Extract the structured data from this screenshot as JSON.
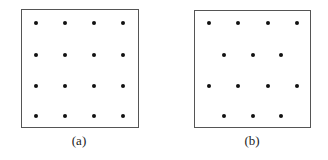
{
  "figure": {
    "panels": [
      {
        "id": "a",
        "caption": "(a)",
        "box": {
          "left": 21,
          "top": 9,
          "width": 118,
          "height": 119
        },
        "caption_center_x": 79,
        "pattern": "square grid 4x4",
        "dots": [
          [
            36,
            23
          ],
          [
            65,
            23
          ],
          [
            94,
            23
          ],
          [
            123,
            23
          ],
          [
            36,
            55
          ],
          [
            65,
            55
          ],
          [
            94,
            55
          ],
          [
            123,
            55
          ],
          [
            36,
            86
          ],
          [
            65,
            86
          ],
          [
            94,
            86
          ],
          [
            123,
            86
          ],
          [
            36,
            116
          ],
          [
            65,
            116
          ],
          [
            94,
            116
          ],
          [
            123,
            116
          ]
        ]
      },
      {
        "id": "b",
        "caption": "(b)",
        "box": {
          "left": 194,
          "top": 10,
          "width": 117,
          "height": 118
        },
        "caption_center_x": 252,
        "pattern": "staggered rows 4-3-4-3",
        "dots": [
          [
            209,
            23
          ],
          [
            238,
            23
          ],
          [
            268,
            23
          ],
          [
            297,
            23
          ],
          [
            224,
            55
          ],
          [
            253,
            55
          ],
          [
            281,
            55
          ],
          [
            209,
            86
          ],
          [
            238,
            86
          ],
          [
            268,
            86
          ],
          [
            297,
            86
          ],
          [
            224,
            116
          ],
          [
            253,
            116
          ],
          [
            281,
            116
          ]
        ]
      }
    ],
    "caption_y": 134,
    "colors": {
      "border": "#555555",
      "dot": "#111111",
      "text": "#222222"
    }
  }
}
